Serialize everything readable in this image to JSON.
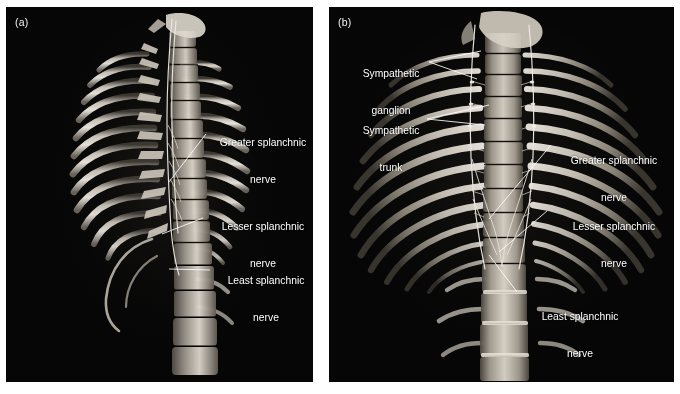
{
  "figure": {
    "type": "3d-ct-volume-rendering",
    "modality": "CT",
    "background_color": "#ffffff",
    "panel_background_color": "#000000",
    "label_color": "#ffffff"
  },
  "panels": [
    {
      "id": "a",
      "label": "(a)",
      "view": "lateral oblique view of thoracic and lumbar spine",
      "annotations": [
        {
          "name": "greater-splanchnic-nerve",
          "line1": "Greater splanchnic",
          "line2": "nerve"
        },
        {
          "name": "lesser-splanchnic-nerve",
          "line1": "Lesser splanchnic",
          "line2": "nerve"
        },
        {
          "name": "least-splanchnic-nerve",
          "line1": "Least splanchnic",
          "line2": "nerve"
        }
      ]
    },
    {
      "id": "b",
      "label": "(b)",
      "view": "posterior coronal view of thoracic and lumbar spine with ribs",
      "annotations": [
        {
          "name": "sympathetic-ganglion",
          "line1": "Sympathetic",
          "line2": "ganglion"
        },
        {
          "name": "sympathetic-trunk",
          "line1": "Sympathetic",
          "line2": "trunk"
        },
        {
          "name": "greater-splanchnic-nerve",
          "line1": "Greater splanchnic",
          "line2": "nerve"
        },
        {
          "name": "lesser-splanchnic-nerve",
          "line1": "Lesser splanchnic",
          "line2": "nerve"
        },
        {
          "name": "least-splanchnic-nerve",
          "line1": "Least splanchnic",
          "line2": "nerve"
        }
      ]
    }
  ]
}
